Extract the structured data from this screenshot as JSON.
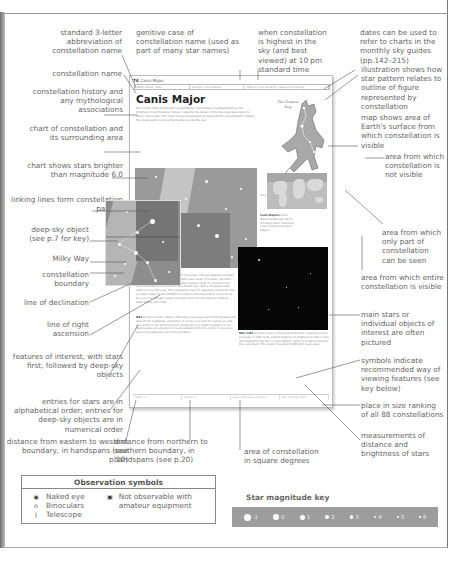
{
  "annotations_left": [
    {
      "id": "abbrev",
      "text": "standard 3-letter abbreviation of constellation name"
    },
    {
      "id": "name",
      "text": "constellation name"
    },
    {
      "id": "history",
      "text": "constellation history and any mythological associations"
    },
    {
      "id": "chart",
      "text": "chart of constellation and its surrounding area"
    },
    {
      "id": "magnitude",
      "text": "chart shows stars brighter than magnitude 6.0"
    },
    {
      "id": "linking",
      "text": "linking lines form constellation pattern"
    },
    {
      "id": "deepsky",
      "text": "deep-sky object (see p.7 for key)"
    },
    {
      "id": "milkyway",
      "text": "Milky Way"
    },
    {
      "id": "boundary",
      "text": "constellation boundary"
    },
    {
      "id": "declination",
      "text": "line of declination"
    },
    {
      "id": "ascension",
      "text": "line of right ascension"
    },
    {
      "id": "features",
      "text": "features of interest, with stars first, followed by deep-sky objects"
    },
    {
      "id": "entries",
      "text": "entries for stars are in alphabetical order; entries for deep-sky objects are in numerical order"
    },
    {
      "id": "width",
      "text": "distance from eastern to western boundary, in handspans (see p.20)"
    }
  ],
  "annotations_top": [
    {
      "id": "genitive",
      "text": "genitive case of constellation name (used as part of many star names)"
    },
    {
      "id": "highest",
      "text": "when constellation is highest in the sky (and best viewed) at 10 pm standard time"
    },
    {
      "id": "dates",
      "text": "dates can be used to refer to charts in the monthly sky guides (pp.142–215)"
    }
  ],
  "annotations_right": [
    {
      "id": "illustration",
      "text": "illustration shows how star pattern relates to outline of figure represented by constellation"
    },
    {
      "id": "map",
      "text": "map shows area of Earth's surface from which constellation is visible"
    },
    {
      "id": "notvisible",
      "text": "area from which constellation is not visible"
    },
    {
      "id": "partvisible",
      "text": "area from which only part of constellation can be seen"
    },
    {
      "id": "entirevisible",
      "text": "area from which entire constellation is visible"
    },
    {
      "id": "pictured",
      "text": "main stars or individual objects of interest are often pictured"
    },
    {
      "id": "symbols",
      "text": "symbols indicate recommended way of viewing features (see key below)"
    },
    {
      "id": "ranking",
      "text": "place in size ranking of all 88 constellations"
    },
    {
      "id": "measurements",
      "text": "measurements of distance and brightness of stars"
    }
  ],
  "annotations_bottom": [
    {
      "id": "height",
      "text": "distance from northern to southern boundary, in handspans (see p.20)"
    },
    {
      "id": "area",
      "text": "area of constellation in square degrees"
    }
  ],
  "mini_page": {
    "page_number": "74",
    "running_head": "Canis Major",
    "info_bar": [
      "Abbreviation: CMa",
      "Genitive: Canis Majoris",
      "Highest in sky at 10 pm: January to February"
    ],
    "title": "Canis Major",
    "intro": "One of the most prominent constellations, Canis Major is embellished by the brightest of all the stars, Sirius. It depicts the larger of the two dogs belonging to Orion, the hunter (the other being represented by Canis Minor). As the Earth rotates, the dogs seem to follow the hunter across the sky.",
    "figure_label": "The Greater Dog",
    "visibility_caption": "Fully visible: 56°N–90°S",
    "sirius_entry_head": "Sirius (Alpha Canis Majoris, The Dog Star)",
    "sirius_entry": "Sirius's magnitude -1.46 is brightest of all stars. This star appears so bright because of its proximity to us (8.6 light years away). It is white, but often appears to flash colourfully as its light is broken up by air currents in the Earth's atmosphere. Sirius is a close double star, with a companion that orbits it every 50 years. This companion, Sirius B, popularly termed the Pup, is a white dwarf nearly 10,000 times fainter than Sirius itself. Hence it can be seen only through a large telescope when the two stars are farthest apart during each orbit.",
    "m41_entry_head": "M41",
    "m41_entry": "An open cluster, about 2,300 light years away and containing about 80 stars of 7th magnitude and fainter. It can be seen with the naked eye and was known to the ancient Greeks. Binoculars or a small telescope reveal that its stars are arranged in chains radiating from the centre. It covers an area of sky about the size of the full Moon.",
    "side_entry_head": "Canis Majoris",
    "side_entry": "Canis Majoris bright star top of the dog's head, marks the centre of Delta (δ) Canis Majoris.",
    "ngc_entry_head": "NGC 2362",
    "ngc_entry": "An open cluster, small and condensed, requiring a small telescope in order to be studied properly. Its brightest member is the 4th magnitude star Tau (τ) Canis Majoris, which is a highly luminous blue supergiant. The cluster lies about 5,000 light years away.",
    "footer": [
      "Width: ½",
      "Depth: ½",
      "Area: 380 square degrees",
      "Size ranking: 43rd"
    ]
  },
  "observation_symbols": {
    "title": "Observation symbols",
    "items": [
      {
        "icon": "naked-eye-icon",
        "glyph": "◉",
        "label": "Naked eye"
      },
      {
        "icon": "binoculars-icon",
        "glyph": "∩",
        "label": "Binoculars"
      },
      {
        "icon": "telescope-icon",
        "glyph": "⟩",
        "label": "Telescope"
      },
      {
        "icon": "not-observable-icon",
        "glyph": "▣",
        "label": "Not observable with amateur equipment"
      }
    ]
  },
  "star_magnitude_key": {
    "title": "Star magnitude key",
    "items": [
      {
        "label": "-1",
        "size": 7
      },
      {
        "label": "0",
        "size": 6
      },
      {
        "label": "1",
        "size": 5
      },
      {
        "label": "2",
        "size": 4
      },
      {
        "label": "3",
        "size": 3.4
      },
      {
        "label": "4",
        "size": 2.6
      },
      {
        "label": "5",
        "size": 2
      },
      {
        "label": "6",
        "size": 1.5
      }
    ]
  },
  "colors": {
    "annotation_text": "#666666",
    "chart_grey": "#9a9a9a",
    "milky_way": "#c4c4c4",
    "photo_black": "#060606",
    "key_bar": "#9d9d9d"
  }
}
